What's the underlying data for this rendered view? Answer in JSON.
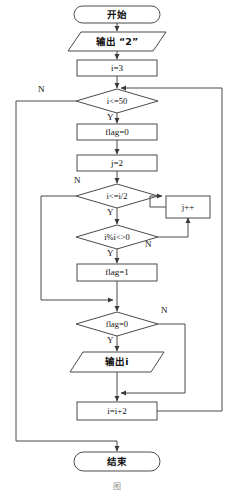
{
  "diagram": {
    "stroke_color": "#4a4a4a",
    "text_color": "#111111",
    "background": "#ffffff",
    "nodes": [
      {
        "id": "start",
        "shape": "terminator",
        "text": "开始",
        "x": 74,
        "y": 6,
        "w": 86,
        "h": 17
      },
      {
        "id": "print2",
        "shape": "parallelogram",
        "text": "输出 “2”",
        "x": 68,
        "y": 32,
        "w": 98,
        "h": 19
      },
      {
        "id": "i3",
        "shape": "process",
        "text": "i=3",
        "x": 77,
        "y": 60,
        "w": 80,
        "h": 16
      },
      {
        "id": "cond50",
        "shape": "decision",
        "text": "i<=50",
        "x": 76,
        "y": 89,
        "w": 82,
        "h": 24
      },
      {
        "id": "flag0",
        "shape": "process",
        "text": "flag=0",
        "x": 77,
        "y": 124,
        "w": 80,
        "h": 16
      },
      {
        "id": "j2",
        "shape": "process",
        "text": "j=2",
        "x": 77,
        "y": 155,
        "w": 80,
        "h": 16
      },
      {
        "id": "condhalf",
        "shape": "decision",
        "text": "i<=i/2",
        "x": 76,
        "y": 184,
        "w": 82,
        "h": 24
      },
      {
        "id": "jplus",
        "shape": "process",
        "text": "j++",
        "x": 166,
        "y": 196,
        "w": 44,
        "h": 22
      },
      {
        "id": "condmod",
        "shape": "decision",
        "text": "i%i<>0",
        "x": 76,
        "y": 225,
        "w": 82,
        "h": 24
      },
      {
        "id": "flag1",
        "shape": "process",
        "text": "flag=1",
        "x": 77,
        "y": 264,
        "w": 80,
        "h": 17
      },
      {
        "id": "condflag",
        "shape": "decision",
        "text": "flag=0",
        "x": 76,
        "y": 312,
        "w": 82,
        "h": 24
      },
      {
        "id": "printi",
        "shape": "parallelogram",
        "text": "输出i",
        "x": 70,
        "y": 352,
        "w": 94,
        "h": 20
      },
      {
        "id": "ii2",
        "shape": "process",
        "text": "i=i+2",
        "x": 77,
        "y": 402,
        "w": 80,
        "h": 18
      },
      {
        "id": "end",
        "shape": "terminator",
        "text": "结束",
        "x": 74,
        "y": 452,
        "w": 86,
        "h": 19
      }
    ],
    "branch_labels": [
      {
        "id": "cond50-no",
        "text": "N",
        "x": 38,
        "y": 85
      },
      {
        "id": "cond50-yes",
        "text": "Y",
        "x": 107,
        "y": 113
      },
      {
        "id": "condhalf-no",
        "text": "N",
        "x": 74,
        "y": 176
      },
      {
        "id": "condhalf-yes",
        "text": "Y",
        "x": 107,
        "y": 208
      },
      {
        "id": "condmod-no",
        "text": "N",
        "x": 145,
        "y": 240
      },
      {
        "id": "condmod-yes",
        "text": "Y",
        "x": 107,
        "y": 249
      },
      {
        "id": "condflag-no",
        "text": "N",
        "x": 161,
        "y": 306
      },
      {
        "id": "condflag-yes",
        "text": "Y",
        "x": 107,
        "y": 336
      }
    ],
    "caption": "图"
  }
}
